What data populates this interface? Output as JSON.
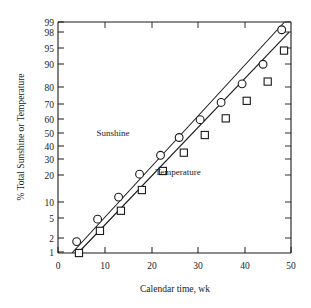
{
  "chart_data": {
    "type": "scatter",
    "title": "",
    "xlabel": "Calendar time, wk",
    "ylabel": "% Total Sunshine or Temperature",
    "xlim": [
      0,
      50
    ],
    "xticks": [
      0,
      10,
      20,
      30,
      40,
      50
    ],
    "xtick_labels": [
      "0",
      "10",
      "20",
      "30",
      "40",
      "50"
    ],
    "yscale": "normal-probability",
    "ylim": [
      1,
      99
    ],
    "yticks": [
      1,
      2,
      5,
      10,
      20,
      30,
      40,
      50,
      60,
      70,
      80,
      90,
      95,
      98,
      99
    ],
    "ytick_labels": [
      "1",
      "2",
      "5",
      "10",
      "20",
      "30",
      "40",
      "50",
      "60",
      "70",
      "80",
      "90",
      "95",
      "98",
      "99"
    ],
    "grid": false,
    "legend": "inline-annotations",
    "series": [
      {
        "name": "Sunshine",
        "marker": "circle",
        "annotation": "Sunshine",
        "x": [
          4,
          8.5,
          13,
          17.5,
          22,
          26,
          30.5,
          35,
          39.5,
          44,
          48
        ],
        "y": [
          1.8,
          5,
          11.5,
          23,
          36,
          50,
          64,
          76,
          86,
          93,
          98.5
        ]
      },
      {
        "name": "Temperature",
        "marker": "square",
        "annotation": "Temperature",
        "x": [
          4.5,
          9,
          13.5,
          18,
          22.5,
          27,
          31.5,
          36,
          40.5,
          45,
          48.5
        ],
        "y": [
          1.0,
          3,
          7,
          14.5,
          25,
          38,
          52,
          65,
          77,
          87,
          96
        ]
      }
    ],
    "fit_lines": [
      {
        "name": "Sunshine fit",
        "x1": 3.0,
        "y1": 1.0,
        "x2": 48.6,
        "y2": 99.0
      },
      {
        "name": "Temperature fit",
        "x1": 4.3,
        "y1": 1.0,
        "x2": 49.6,
        "y2": 98.3
      }
    ]
  }
}
